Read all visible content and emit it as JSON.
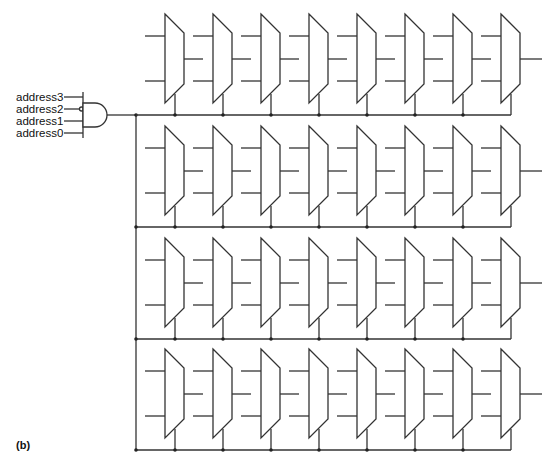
{
  "figure_label": "(b)",
  "decoder": {
    "gate": "and",
    "inputs": [
      {
        "name": "address3",
        "inverted": false
      },
      {
        "name": "address2",
        "inverted": true
      },
      {
        "name": "address1",
        "inverted": false
      },
      {
        "name": "address0",
        "inverted": false
      }
    ]
  },
  "array": {
    "rows": 4,
    "muxes_per_row": 8,
    "row_tops": [
      14,
      126,
      238,
      349
    ],
    "mux_x": [
      165,
      213,
      261,
      309,
      357,
      405,
      453,
      501
    ],
    "colors": {
      "wire": "#333333",
      "background": "#ffffff"
    }
  }
}
